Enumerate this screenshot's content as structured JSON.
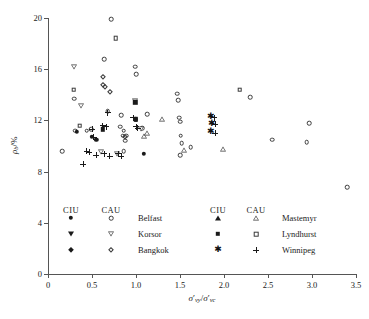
{
  "chart_data": {
    "type": "scatter",
    "title": "",
    "xlabel": "sigma'_vy / sigma'_vc",
    "ylabel": "rho_b / %",
    "xlim": [
      0,
      3.5
    ],
    "ylim": [
      0,
      20
    ],
    "xticks": [
      "0",
      "0.5",
      "1.0",
      "1.5",
      "2.0",
      "2.5",
      "3.0",
      "3.5"
    ],
    "xtick_values": [
      0,
      0.5,
      1.0,
      1.5,
      2.0,
      2.5,
      3.0,
      3.5
    ],
    "yticks": [
      "0",
      "4",
      "8",
      "12",
      "16",
      "20"
    ],
    "ytick_values": [
      0,
      4,
      8,
      12,
      16,
      20
    ],
    "grid": false,
    "legend_position": "inside-bottom",
    "series": [
      {
        "name": "Belfast",
        "test_ciu": "filled-circle",
        "test_cau": "open-circle",
        "points_ciu": [
          [
            0.33,
            11.1
          ],
          [
            0.5,
            10.7
          ],
          [
            0.55,
            10.5
          ],
          [
            1.0,
            12.1
          ],
          [
            1.09,
            9.4
          ]
        ],
        "points_cau": [
          [
            0.16,
            9.6
          ],
          [
            0.31,
            11.2
          ],
          [
            0.3,
            13.7
          ],
          [
            0.44,
            11.2
          ],
          [
            0.49,
            11.3
          ],
          [
            0.64,
            16.8
          ],
          [
            0.68,
            12.7
          ],
          [
            0.72,
            19.9
          ],
          [
            0.83,
            12.4
          ],
          [
            0.82,
            11.5
          ],
          [
            0.85,
            10.8
          ],
          [
            0.86,
            11.2
          ],
          [
            0.86,
            9.6
          ],
          [
            0.88,
            10.4
          ],
          [
            0.89,
            10.8
          ],
          [
            0.99,
            16.2
          ],
          [
            1.0,
            15.6
          ],
          [
            1.07,
            11.4
          ],
          [
            1.13,
            12.5
          ],
          [
            1.47,
            14.1
          ],
          [
            1.48,
            13.6
          ],
          [
            1.49,
            12.2
          ],
          [
            1.5,
            11.9
          ],
          [
            1.51,
            10.8
          ],
          [
            1.52,
            10.2
          ],
          [
            1.5,
            9.3
          ],
          [
            1.62,
            9.9
          ],
          [
            2.3,
            13.8
          ],
          [
            2.55,
            10.5
          ],
          [
            2.94,
            10.3
          ],
          [
            2.97,
            11.8
          ],
          [
            3.4,
            6.8
          ]
        ]
      },
      {
        "name": "Korsor",
        "test_ciu": "filled-down-triangle",
        "test_cau": "open-down-triangle",
        "points_ciu": [],
        "points_cau": [
          [
            0.29,
            16.2
          ],
          [
            0.38,
            13.1
          ],
          [
            0.6,
            9.5
          ],
          [
            0.78,
            9.4
          ],
          [
            0.99,
            13.5
          ],
          [
            1.06,
            11.3
          ]
        ]
      },
      {
        "name": "Bangkok",
        "test_ciu": "filled-diamond",
        "test_cau": "open-diamond",
        "points_ciu": [],
        "points_cau": [
          [
            0.62,
            15.4
          ],
          [
            0.62,
            14.8
          ],
          [
            0.65,
            14.6
          ],
          [
            0.7,
            14.2
          ],
          [
            0.88,
            10.7
          ]
        ]
      },
      {
        "name": "Mastemyr",
        "test_ciu": "filled-up-triangle",
        "test_cau": "open-up-triangle",
        "points_ciu": [],
        "points_cau": [
          [
            1.09,
            10.8
          ],
          [
            1.13,
            11.0
          ],
          [
            1.3,
            12.1
          ],
          [
            1.55,
            9.7
          ],
          [
            1.99,
            9.8
          ]
        ]
      },
      {
        "name": "Lyndhurst",
        "test_ciu": "filled-square",
        "test_cau": "open-square",
        "points_ciu": [
          [
            0.62,
            11.3
          ],
          [
            0.99,
            13.4
          ],
          [
            1.0,
            12.1
          ]
        ],
        "points_cau": [
          [
            0.29,
            14.4
          ],
          [
            0.36,
            11.6
          ],
          [
            0.77,
            18.4
          ],
          [
            2.18,
            14.4
          ]
        ]
      },
      {
        "name": "Winnipeg",
        "test_ciu": "asterisk",
        "test_cau": "plus",
        "points_ciu": [
          [
            1.85,
            12.3
          ],
          [
            1.86,
            11.7
          ],
          [
            1.85,
            11.1
          ]
        ],
        "points_cau": [
          [
            0.4,
            8.6
          ],
          [
            0.44,
            9.6
          ],
          [
            0.47,
            9.5
          ],
          [
            0.52,
            10.7
          ],
          [
            0.5,
            11.3
          ],
          [
            0.55,
            9.3
          ],
          [
            0.62,
            11.6
          ],
          [
            0.66,
            11.5
          ],
          [
            0.64,
            9.4
          ],
          [
            0.68,
            12.6
          ],
          [
            0.7,
            9.2
          ],
          [
            0.8,
            9.4
          ],
          [
            0.83,
            9.2
          ],
          [
            0.97,
            12.2
          ],
          [
            1.0,
            11.5
          ],
          [
            1.02,
            11.4
          ],
          [
            1.89,
            12.2
          ],
          [
            1.9,
            11.7
          ],
          [
            1.9,
            11.0
          ]
        ]
      }
    ]
  },
  "axes": {
    "x_title_main": "σ",
    "x_title_prime": "′",
    "x_title_sub1": "vy",
    "x_title_slash": "/",
    "x_title_main2": "σ",
    "x_title_prime2": "′",
    "x_title_sub2": "vc",
    "y_title_main": "ρ",
    "y_title_sub": "b",
    "y_title_unit": "/%"
  },
  "legend": {
    "header_ciu": "CIU",
    "header_cau": "CAU",
    "groups": [
      {
        "column": "left",
        "rows": [
          {
            "label": "Belfast",
            "ciu_marker": "filled-circle",
            "cau_marker": "open-circle"
          },
          {
            "label": "Korsor",
            "ciu_marker": "filled-down-triangle",
            "cau_marker": "open-down-triangle"
          },
          {
            "label": "Bangkok",
            "ciu_marker": "filled-diamond",
            "cau_marker": "open-diamond"
          }
        ]
      },
      {
        "column": "right",
        "rows": [
          {
            "label": "Mastemyr",
            "ciu_marker": "filled-up-triangle",
            "cau_marker": "open-up-triangle"
          },
          {
            "label": "Lyndhurst",
            "ciu_marker": "filled-square",
            "cau_marker": "open-square"
          },
          {
            "label": "Winnipeg",
            "ciu_marker": "asterisk",
            "cau_marker": "plus"
          }
        ]
      }
    ]
  },
  "colors": {
    "axis": "#555555",
    "marker_open": "#3a3a3a",
    "marker_filled": "#1a1a1a",
    "background": "#ffffff"
  }
}
